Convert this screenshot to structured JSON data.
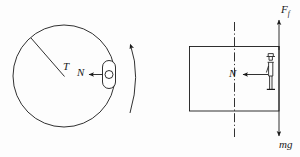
{
  "figure": {
    "name": "rotating-drum-free-body-diagram",
    "background_color": "#fdfdfd",
    "stroke_color": "#1a1a1a",
    "width": 300,
    "height": 157
  },
  "left_diagram": {
    "name": "rotating-drum-top-view",
    "circle": {
      "cx": 64,
      "cy": 76,
      "r": 51
    },
    "radius_line_label": "T",
    "normal_force_label": "N",
    "rider_shape": "capsule-with-circle",
    "rotation_arrow": "curved-arrow-up"
  },
  "right_diagram": {
    "name": "rotating-drum-side-view",
    "rectangle": {
      "x": 189,
      "y": 46,
      "width": 90,
      "height": 65
    },
    "center_line_style": "dash-dot",
    "normal_force_label": "N",
    "friction_force_label": "F",
    "friction_force_subscript": "f",
    "weight_label": "mg",
    "person_shape": "stick-figure-standing"
  },
  "labels": {
    "tension": "T",
    "normal_left": "N",
    "normal_right": "N",
    "friction_main": "F",
    "friction_sub": "f",
    "weight": "mg"
  }
}
